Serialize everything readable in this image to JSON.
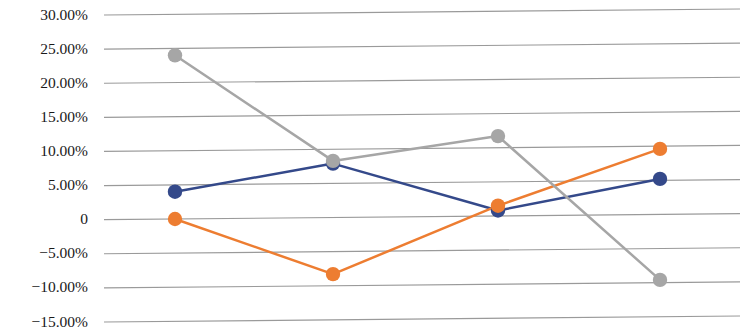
{
  "chart_data": {
    "type": "line",
    "title": "",
    "subtitle": "",
    "xlabel": "",
    "ylabel": "",
    "categories": [
      "1",
      "2",
      "3",
      "4"
    ],
    "ylim": [
      -15,
      30
    ],
    "ytick_values": [
      30,
      25,
      20,
      15,
      10,
      5,
      0,
      -5,
      -10,
      -15
    ],
    "ytick_labels": [
      "30.00%",
      "25.00%",
      "20.00%",
      "15.00%",
      "10.00%",
      "5.00%",
      "0",
      "−5.00%",
      "−10.00%",
      "−15.00%"
    ],
    "grid": true,
    "grid_axis": "y",
    "legend": "none",
    "legend_position": "none",
    "x_axis_labels_visible": false,
    "markers": true,
    "series": [
      {
        "name": "Series 1",
        "color": "#34498a",
        "marker": "circle",
        "values": [
          4.0,
          7.9,
          0.8,
          5.2
        ]
      },
      {
        "name": "Series 2",
        "color": "#ed7d31",
        "marker": "circle",
        "values": [
          0.0,
          -8.3,
          1.5,
          9.6
        ]
      },
      {
        "name": "Series 3",
        "color": "#a6a6a6",
        "marker": "circle",
        "values": [
          24.0,
          8.3,
          11.7,
          -9.6
        ]
      }
    ]
  },
  "style": {
    "background": "#ffffff",
    "gridline_color": "#9a9a9a",
    "tick_label_color": "#1a1a1a"
  },
  "geometry": {
    "plot_left": 104,
    "plot_right": 740,
    "y_for_30pct": 15,
    "y_for_minus15pct": 322,
    "category_x": [
      175,
      333,
      498,
      660
    ],
    "tilt_px": -6
  }
}
